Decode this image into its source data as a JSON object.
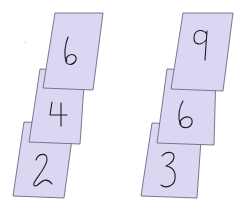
{
  "figure": {
    "card_fill": "#dcd6f2",
    "card_stroke": "#6e6a80",
    "ink_color": "#1a1a22",
    "background": "#ffffff"
  },
  "stacks": [
    {
      "name": "left-stack",
      "cards_top_to_bottom": [
        {
          "position": "top",
          "digit": "6"
        },
        {
          "position": "middle",
          "digit": "4"
        },
        {
          "position": "bottom",
          "digit": "2"
        }
      ]
    },
    {
      "name": "right-stack",
      "cards_top_to_bottom": [
        {
          "position": "top",
          "digit": "9"
        },
        {
          "position": "middle",
          "digit": "6"
        },
        {
          "position": "bottom",
          "digit": "3"
        }
      ]
    }
  ]
}
